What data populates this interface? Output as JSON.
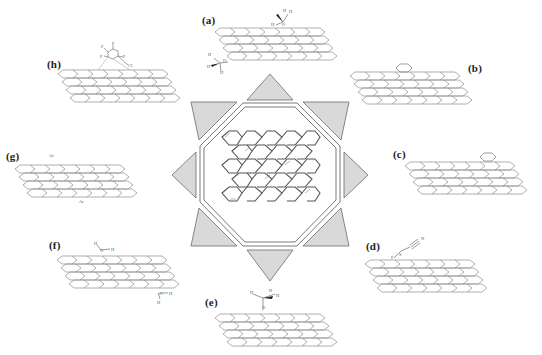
{
  "figure": {
    "type": "schematic",
    "colors": {
      "background": "#ffffff",
      "line": "#6b6b6b",
      "triangle_fill": "#d9d9d9",
      "sheet_line": "#8a8a8a",
      "label": "#222222"
    }
  },
  "center": {
    "name": "graphene-flake",
    "hexagon_rows": 5,
    "hexagons_per_row": 5
  },
  "panels": [
    {
      "id": "a",
      "label": "(a)",
      "adsorbate": "two tetrahedral molecules (above and below sheet)",
      "atoms_top": [
        "H",
        "H",
        "H",
        "O"
      ],
      "atoms_bottom": [
        "H",
        "H",
        "H",
        "O"
      ]
    },
    {
      "id": "b",
      "label": "(b)",
      "adsorbate": "ring molecule above sheet"
    },
    {
      "id": "c",
      "label": "(c)",
      "adsorbate": "ring molecule above sheet"
    },
    {
      "id": "d",
      "label": "(d)",
      "adsorbate": "linear chain with triple bond",
      "atoms": [
        "F",
        "S",
        "N"
      ]
    },
    {
      "id": "e",
      "label": "(e)",
      "adsorbate": "tetrahedral molecule above sheet",
      "atoms": [
        "H",
        "H",
        "H",
        "O"
      ]
    },
    {
      "id": "f",
      "label": "(f)",
      "adsorbate": "bent molecules above and below sheet",
      "atoms_top": [
        "H",
        "O",
        "H"
      ],
      "atoms_bottom": [
        "H",
        "O",
        "H"
      ]
    },
    {
      "id": "g",
      "label": "(g)",
      "adsorbate": "single atoms above and below sheet",
      "atoms": [
        "Ar",
        "Ar"
      ]
    },
    {
      "id": "h",
      "label": "(h)",
      "adsorbate": "substituted benzene ring tilted above sheet",
      "atoms": [
        "F",
        "F",
        "F",
        "F",
        "Cl"
      ]
    }
  ]
}
